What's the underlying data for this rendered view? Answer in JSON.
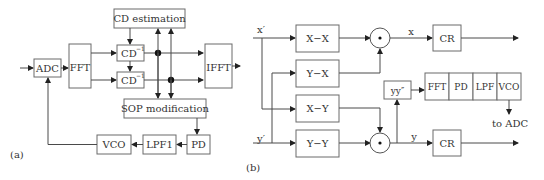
{
  "panel_a": {
    "caption": "(a)",
    "blocks": {
      "adc": "ADC",
      "fft": "FFT",
      "cd_estimation": "CD estimation",
      "cd_inv_top": "CD",
      "cd_inv_bottom": "CD",
      "cd_inv_superscript": "−1",
      "ifft": "IFFT",
      "sop_modification": "SOP modification",
      "pd": "PD",
      "lpf1": "LPF1",
      "vco": "VCO"
    }
  },
  "panel_b": {
    "caption": "(b)",
    "inputs": {
      "x_prime": "x′",
      "y_prime": "y′"
    },
    "blocks": {
      "xx": "X−X",
      "yx": "Y−X",
      "xy": "X−Y",
      "yy": "Y−Y",
      "cr_top": "CR",
      "cr_bottom": "CR",
      "yy_dprime": "yy″",
      "fft": "FFT",
      "pd": "PD",
      "lpf": "LPF",
      "vco": "VCO"
    },
    "signals": {
      "x": "x",
      "y": "y"
    },
    "output_note": "to ADC",
    "multiplier_symbol": "⊙"
  },
  "colors": {
    "line": "#4a4a4a",
    "block_border": "#6a6a6a",
    "text": "#333333",
    "background": "#ffffff"
  }
}
